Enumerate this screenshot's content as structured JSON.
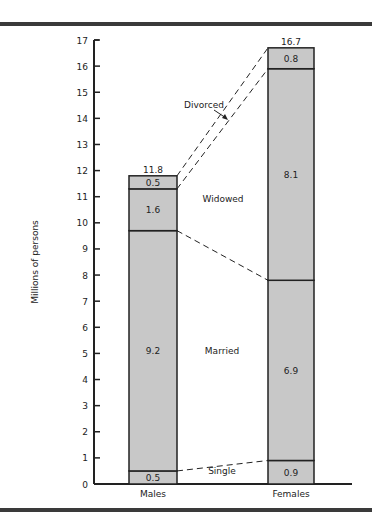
{
  "chart_data": {
    "type": "bar",
    "stacked": true,
    "title": "",
    "xlabel": "",
    "ylabel": "Millions of persons",
    "ylim": [
      0,
      17
    ],
    "yticks": [
      0,
      1,
      2,
      3,
      4,
      5,
      6,
      7,
      8,
      9,
      10,
      11,
      12,
      13,
      14,
      15,
      16,
      17
    ],
    "categories": [
      "Males",
      "Females"
    ],
    "series": [
      {
        "name": "Single",
        "values": [
          0.5,
          0.9
        ]
      },
      {
        "name": "Married",
        "values": [
          9.2,
          6.9
        ]
      },
      {
        "name": "Widowed",
        "values": [
          1.6,
          8.1
        ]
      },
      {
        "name": "Divorced",
        "values": [
          0.5,
          0.8
        ]
      }
    ],
    "totals": [
      11.8,
      16.7
    ],
    "segment_labels": {
      "Males": [
        "0.5",
        "9.2",
        "1.6",
        "0.5"
      ],
      "Females": [
        "0.9",
        "6.9",
        "8.1",
        "0.8"
      ]
    },
    "total_labels": [
      "11.8",
      "16.7"
    ],
    "annotations": [
      "Single",
      "Married",
      "Widowed",
      "Divorced"
    ],
    "grid": false,
    "legend": "none (segment names annotated between bars with dashed connector lines)",
    "colors": {
      "bar_fill": "#c8c8c8",
      "stroke": "#222222",
      "rules": "#3a3a3a"
    }
  }
}
